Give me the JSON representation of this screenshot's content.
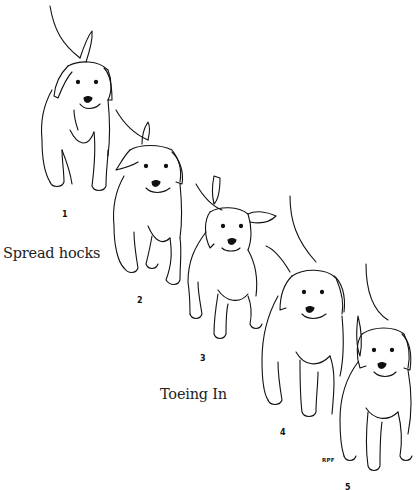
{
  "figure": {
    "labels": {
      "spread_hocks": "Spread hocks",
      "toeing_in": "Toeing In"
    },
    "numbers": [
      "1",
      "2",
      "3",
      "4",
      "5"
    ],
    "signature": "RPF",
    "line_color": "#111111",
    "background": "#ffffff"
  }
}
